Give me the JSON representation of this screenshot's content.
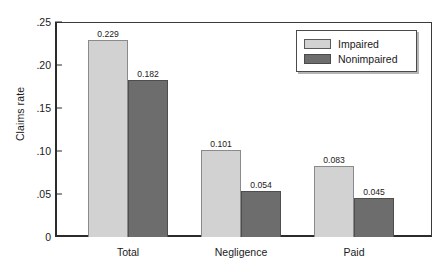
{
  "chart_data": {
    "type": "bar",
    "title": "",
    "subtitle": "",
    "xlabel": "",
    "ylabel": "Claims rate",
    "categories": [
      "Total",
      "Negligence",
      "Paid"
    ],
    "series": [
      {
        "name": "Impaired",
        "color": "#d2d2d2",
        "values": [
          0.229,
          0.101,
          0.083
        ],
        "labels": [
          "0.229",
          "0.101",
          "0.083"
        ]
      },
      {
        "name": "Nonimpaired",
        "color": "#6d6d6d",
        "values": [
          0.182,
          0.054,
          0.045
        ],
        "labels": [
          "0.182",
          "0.054",
          "0.045"
        ]
      }
    ],
    "ylim": [
      0,
      0.25
    ],
    "ytick_values": [
      0.25,
      0.2,
      0.15,
      0.1,
      0.05,
      0
    ],
    "ytick_labels": [
      ".25",
      ".20",
      ".15",
      ".10",
      ".05",
      "0"
    ],
    "grid": false,
    "legend_position": "top-right",
    "legend_entries": [
      "Impaired",
      "Nonimpaired"
    ]
  }
}
